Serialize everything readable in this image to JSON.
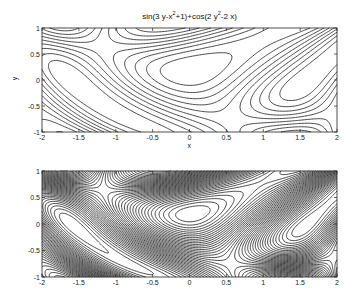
{
  "chart_data": [
    {
      "type": "contour",
      "title": "sin(3 y-x^2+1)+cos(2 y^2-2 x)",
      "title_parts": {
        "a": "sin(3 y-x",
        "b": "2",
        "c": "+1)+cos(2 y",
        "d": "2",
        "e": "-2 x)"
      },
      "function": "sin(3*y - x^2 + 1) + cos(2*y^2 - 2*x)",
      "xlabel": "x",
      "ylabel": "y",
      "xlim": [
        -2,
        2
      ],
      "ylim": [
        -1,
        1
      ],
      "xticks": [
        -2,
        -1.5,
        -1,
        -0.5,
        0,
        0.5,
        1,
        1.5,
        2
      ],
      "xtick_labels": [
        "-2",
        "-1.5",
        "-1",
        "-0.5",
        "0",
        "0.5",
        "1",
        "1.5",
        "2"
      ],
      "yticks": [
        -1,
        -0.5,
        0,
        0.5,
        1
      ],
      "ytick_labels": [
        "-1",
        "-0.5",
        "0",
        "0.5",
        "1"
      ],
      "levels": 10,
      "grid": false,
      "line_color": "#1a1a1a"
    },
    {
      "type": "contour",
      "title": "",
      "function": "sin(3*y - x^2 + 1) + cos(2*y^2 - 2*x)",
      "xlabel": "",
      "ylabel": "",
      "xlim": [
        -2,
        2
      ],
      "ylim": [
        -1,
        1
      ],
      "xticks": [
        -2,
        -1.5,
        -1,
        -0.5,
        0,
        0.5,
        1,
        1.5,
        2
      ],
      "xtick_labels": [
        "-2",
        "-1.5",
        "-1",
        "-0.5",
        "0",
        "0.5",
        "1",
        "1.5",
        "2"
      ],
      "yticks": [
        -1,
        -0.5,
        0,
        0.5,
        1
      ],
      "ytick_labels": [
        "-1",
        "-0.5",
        "0",
        "0.5",
        "1"
      ],
      "levels": 40,
      "grid": false,
      "line_color": "#1a1a1a"
    }
  ],
  "layout": {
    "plots": [
      {
        "left": 42,
        "top": 28,
        "width": 295,
        "height": 104
      },
      {
        "left": 42,
        "top": 171,
        "width": 295,
        "height": 106
      }
    ]
  }
}
